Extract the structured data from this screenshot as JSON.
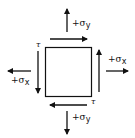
{
  "diagram": {
    "type": "stress-element",
    "element": "square",
    "labels": {
      "sigma_y_top": "+σy",
      "sigma_y_bottom": "+σy",
      "sigma_x_left": "+σx",
      "sigma_x_right": "+σx",
      "tau_top_left": "τ",
      "tau_bottom_right": "τ"
    },
    "sigma_y_top_plus": "+σ",
    "sigma_y_top_sub": "y",
    "sigma_y_bottom_plus": "+σ",
    "sigma_y_bottom_sub": "y",
    "sigma_x_left_plus": "+σ",
    "sigma_x_left_sub": "x",
    "sigma_x_right_plus": "+σ",
    "sigma_x_right_sub": "x",
    "arrows": [
      {
        "name": "sigma-y-top",
        "direction": "up"
      },
      {
        "name": "sigma-y-bottom",
        "direction": "down"
      },
      {
        "name": "sigma-x-left",
        "direction": "left"
      },
      {
        "name": "sigma-x-right",
        "direction": "right"
      },
      {
        "name": "shear-top",
        "direction": "right"
      },
      {
        "name": "shear-bottom",
        "direction": "left"
      },
      {
        "name": "shear-left",
        "direction": "down"
      },
      {
        "name": "shear-right",
        "direction": "up"
      }
    ],
    "colors": {
      "stroke": "#111111",
      "background": "#ffffff"
    }
  }
}
